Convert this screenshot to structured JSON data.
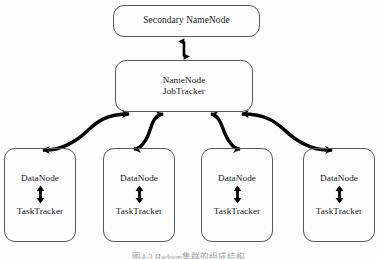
{
  "figure": {
    "background_color": "#fdfdfd",
    "border_color": "#555a5e",
    "text_color": "#14181b",
    "arrow_color": "#000000",
    "caption": "图4-3  Hadoop集群的组成结构"
  },
  "nodes": {
    "secondary_namenode": {
      "label": "Secondary NameNode"
    },
    "namenode_jobtracker": {
      "line1": "NameNode",
      "line2": "JobTracker"
    },
    "datanodes": [
      {
        "line1": "DataNode",
        "line2": "TaskTracker"
      },
      {
        "line1": "DataNode",
        "line2": "TaskTracker"
      },
      {
        "line1": "DataNode",
        "line2": "TaskTracker"
      },
      {
        "line1": "DataNode",
        "line2": "TaskTracker"
      }
    ]
  },
  "connectors": {
    "secondary_to_namenode": {
      "name": "vertical-double-arrow",
      "direction": "bidirectional"
    },
    "namenode_to_datanodes": {
      "name": "curved-double-arrow",
      "direction": "bidirectional",
      "count": 4
    },
    "datanode_internal": {
      "name": "vertical-double-arrow",
      "direction": "bidirectional"
    }
  }
}
